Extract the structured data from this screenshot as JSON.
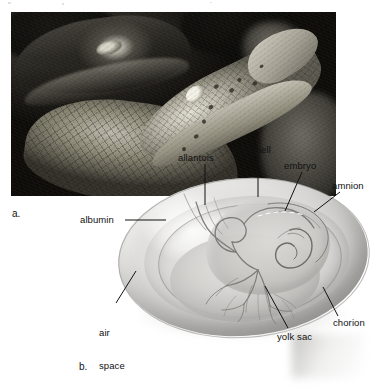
{
  "figure": {
    "type": "biology-textbook-figure",
    "panels": [
      {
        "id": "a",
        "letter": "a.",
        "kind": "photograph",
        "subject": "alligator with juvenile alligator"
      },
      {
        "id": "b",
        "letter": "b.",
        "kind": "illustration",
        "subject": "amniotic egg cross-section"
      }
    ],
    "labels": [
      {
        "id": "allantois",
        "text": "allantois"
      },
      {
        "id": "egg-shell",
        "text": "egg shell"
      },
      {
        "id": "embryo",
        "text": "embryo"
      },
      {
        "id": "amnion",
        "text": "amnion"
      },
      {
        "id": "albumin",
        "text": "albumin"
      },
      {
        "id": "air-space",
        "text": "air\nspace"
      },
      {
        "id": "air-space-line1",
        "text": "air"
      },
      {
        "id": "air-space-line2",
        "text": "space"
      },
      {
        "id": "yolk-sac",
        "text": "yolk sac"
      },
      {
        "id": "chorion",
        "text": "chorion"
      }
    ],
    "colors": {
      "background": "#ffffff",
      "text": "#111111",
      "leader_line": "#111111",
      "photo_dark": "#15140f",
      "egg_shell": "#dedddb",
      "egg_highlight": "#ffffff"
    }
  }
}
